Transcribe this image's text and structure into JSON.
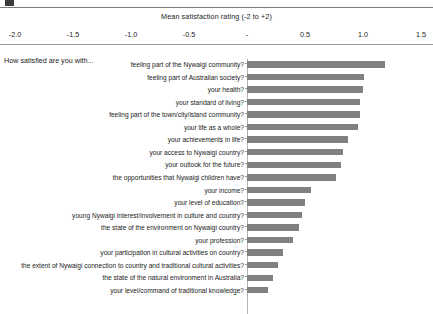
{
  "figure": {
    "prompt": "How satisfied are you with...",
    "axis_title": "Mean satisfaction rating (-2 to +2)"
  },
  "chart_data": {
    "type": "bar",
    "orientation": "horizontal",
    "title": "Mean satisfaction rating (-2 to +2)",
    "xlabel": "Mean satisfaction rating (-2 to +2)",
    "ylabel": "How satisfied are you with...",
    "xlim": [
      -2.0,
      1.75
    ],
    "xticks": [
      -2.0,
      -1.5,
      -1.0,
      -0.5,
      0,
      0.5,
      1.0,
      1.5
    ],
    "xticklabels": [
      "-2.0",
      "-1.5",
      "-1.0",
      "-0.5",
      "-",
      "0.5",
      "1.0",
      "1.5"
    ],
    "grid": false,
    "legend": null,
    "bar_color": "#808080",
    "categories": [
      "feeling part of the Nywaigi community?",
      "feeling part of Australian society?",
      "your health?",
      "your standard of living?",
      "feeling part of the town/city/island community?",
      "your life as a whole?",
      "your achievements in life?",
      "your access to Nywaigi country?",
      "your outlook for the future?",
      "the opportunities that Nywaigi children have?",
      "your income?",
      "your level of education?",
      "young Nywaigi interest/involvement in culture and country?",
      "the state of the environment on Nywaigi country?",
      "your profession?",
      "your participation in cultural activities on country?",
      "the extent of Nywaigi connection to country and traditional cultural activities?",
      "the state of the natural environment in Australia?",
      "your level/command of traditional knowledge?"
    ],
    "values": [
      1.19,
      1.01,
      1.0,
      0.97,
      0.97,
      0.96,
      0.87,
      0.83,
      0.81,
      0.77,
      0.55,
      0.5,
      0.47,
      0.45,
      0.4,
      0.31,
      0.27,
      0.22,
      0.18
    ]
  }
}
